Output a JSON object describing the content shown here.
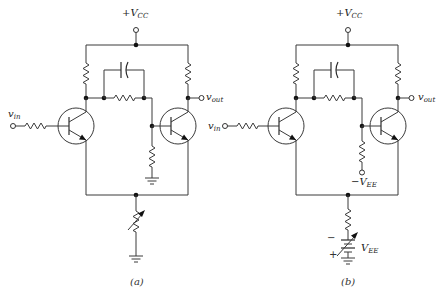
{
  "figure": {
    "panels": [
      {
        "id": "a",
        "caption": "(a)",
        "supply_label": "+V",
        "supply_sub": "CC",
        "input_label": "v",
        "input_sub": "in",
        "output_label": "v",
        "output_sub": "out",
        "tail_element": "variable-resistor-to-ground",
        "q2_base_return": "resistor-to-ground"
      },
      {
        "id": "b",
        "caption": "(b)",
        "supply_label": "+V",
        "supply_sub": "CC",
        "input_label": "v",
        "input_sub": "in",
        "output_label": "v",
        "output_sub": "out",
        "q2_base_return_label": "−V",
        "q2_base_return_sub": "EE",
        "tail_source_label": "V",
        "tail_source_sub": "EE",
        "tail_minus": "−",
        "tail_plus": "+",
        "tail_element": "resistor-plus-variable-battery"
      }
    ],
    "colors": {
      "line": "#3a3a3a",
      "node": "#111111",
      "background": "#ffffff"
    }
  }
}
